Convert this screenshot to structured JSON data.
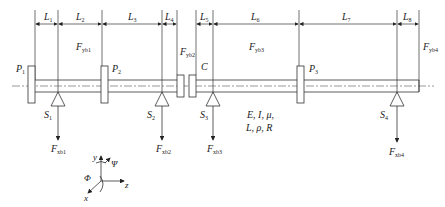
{
  "diagram": {
    "type": "rotor-shaft-system",
    "segments": [
      {
        "label": "L",
        "sub": "1",
        "x1": 35,
        "x2": 58
      },
      {
        "label": "L",
        "sub": "2",
        "x1": 58,
        "x2": 102
      },
      {
        "label": "L",
        "sub": "3",
        "x1": 102,
        "x2": 162
      },
      {
        "label": "L",
        "sub": "4",
        "x1": 162,
        "x2": 177
      },
      {
        "label": "L",
        "sub": "5",
        "x1": 196,
        "x2": 213
      },
      {
        "label": "L",
        "sub": "6",
        "x1": 213,
        "x2": 299
      },
      {
        "label": "L",
        "sub": "7",
        "x1": 299,
        "x2": 397
      },
      {
        "label": "L",
        "sub": "8",
        "x1": 397,
        "x2": 419
      }
    ],
    "disks": [
      {
        "label": "P",
        "sub": "1",
        "x": 31
      },
      {
        "label": "P",
        "sub": "2",
        "x": 104
      },
      {
        "label": "P",
        "sub": "3",
        "x": 300
      }
    ],
    "supports": [
      {
        "label": "S",
        "sub": "1",
        "x": 58,
        "force": "F",
        "force_sub": "xb1"
      },
      {
        "label": "S",
        "sub": "2",
        "x": 162,
        "force": "F",
        "force_sub": "xb2"
      },
      {
        "label": "S",
        "sub": "3",
        "x": 213,
        "force": "F",
        "force_sub": "xb3"
      },
      {
        "label": "S",
        "sub": "4",
        "x": 397,
        "force": "F",
        "force_sub": "xb4"
      }
    ],
    "bearing_forces_y": [
      {
        "label": "F",
        "sub": "yb1",
        "x": 96,
        "y": 50
      },
      {
        "label": "F",
        "sub": "yb2",
        "x": 167,
        "y": 50
      },
      {
        "label": "F",
        "sub": "yb3",
        "x": 249,
        "y": 50
      },
      {
        "label": "F",
        "sub": "yb4",
        "x": 426,
        "y": 50
      }
    ],
    "coupling_label": "C",
    "properties_line1": "E, I, μ,",
    "properties_line2": "L, ρ, R",
    "axes": {
      "y": "y",
      "z": "z",
      "x": "x",
      "psi": "Ψ",
      "phi": "Φ"
    }
  }
}
